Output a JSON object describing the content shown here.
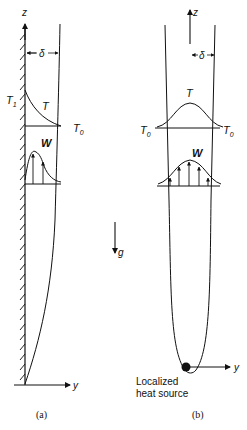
{
  "figure": {
    "panel_a": {
      "caption": "(a)",
      "axis_z": "z",
      "axis_y": "y",
      "delta_label": "δ",
      "wall_temp_label": "T",
      "wall_temp_sub": "1",
      "temp_profile_label": "T",
      "ambient_temp_label": "T",
      "ambient_temp_sub": "0",
      "velocity_profile_label": "W"
    },
    "panel_b": {
      "caption": "(b)",
      "axis_z": "z",
      "axis_y": "y",
      "delta_label": "δ",
      "temp_profile_label": "T",
      "ambient_left_label": "T",
      "ambient_left_sub": "0",
      "ambient_right_label": "T",
      "ambient_right_sub": "0",
      "velocity_profile_label": "W",
      "source_label_line1": "Localized",
      "source_label_line2": "heat source"
    },
    "gravity_label": "g",
    "colors": {
      "ink": "#111111",
      "background": "#ffffff"
    }
  }
}
